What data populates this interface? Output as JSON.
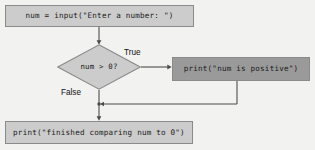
{
  "diagram": {
    "type": "flowchart",
    "background_color": "#f2f2f0",
    "line_color": "#4d4d4d",
    "nodes": {
      "input": {
        "label": "num = input(\"Enter a number: \")",
        "shape": "rectangle",
        "fill": "#cccccc"
      },
      "decision": {
        "label": "num > 0?",
        "shape": "diamond",
        "fill": "#cccccc"
      },
      "true_branch": {
        "label": "print(\"num is positive\")",
        "shape": "rectangle",
        "fill": "#9a9a9a"
      },
      "final": {
        "label": "print(\"finished comparing num to 0\")",
        "shape": "rectangle",
        "fill": "#cccccc"
      }
    },
    "edges": {
      "true_label": "True",
      "false_label": "False"
    }
  }
}
